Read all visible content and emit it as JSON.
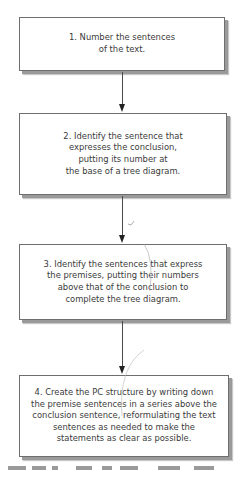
{
  "diagram": {
    "type": "flowchart",
    "steps": [
      {
        "number": "1",
        "text": "1. Number the sentences\nof the text."
      },
      {
        "number": "2",
        "text": "2. Identify the sentence that\nexpresses the conclusion,\nputting its number at\nthe base of a tree diagram."
      },
      {
        "number": "3",
        "text": "3. Identify the sentences that express\nthe premises, putting their numbers\nabove that of the conclusion to\ncomplete the tree diagram."
      },
      {
        "number": "4",
        "text": "4. Create the PC structure by writing down\nthe premise sentences in a series above the\nconclusion sentence, reformulating the text\nsentences as needed to make the\nstatements as clear as possible."
      }
    ],
    "connectors": [
      "step1-to-step2",
      "step2-to-step3",
      "step3-to-step4"
    ],
    "colors": {
      "border": "#6e6e6e",
      "shadow": "#9a9a9a",
      "text": "#3a3a3a",
      "arrow": "#222222"
    }
  }
}
